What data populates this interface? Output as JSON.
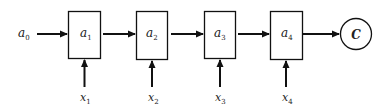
{
  "diagram": {
    "type": "unrolled-rnn-chain",
    "initial_state": {
      "label": "a",
      "sub": "0"
    },
    "nodes": [
      {
        "label": "a",
        "sub": "1",
        "input": {
          "label": "x",
          "sub": "1"
        }
      },
      {
        "label": "a",
        "sub": "2",
        "input": {
          "label": "x",
          "sub": "2"
        }
      },
      {
        "label": "a",
        "sub": "3",
        "input": {
          "label": "x",
          "sub": "3"
        }
      },
      {
        "label": "a",
        "sub": "4",
        "input": {
          "label": "x",
          "sub": "4"
        }
      }
    ],
    "output": {
      "label": "C"
    },
    "colors": {
      "stroke": "#111111",
      "text": "#222222",
      "background": "#ffffff"
    }
  }
}
